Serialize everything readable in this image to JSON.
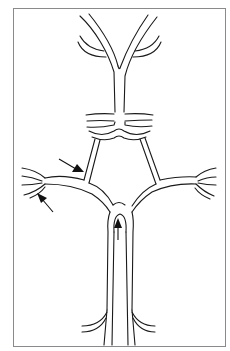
{
  "figure": {
    "type": "schematic line drawing",
    "arrows": [
      {
        "id": "arrow-left-upper",
        "direction": "down-right",
        "target": "left upper connecting segment"
      },
      {
        "id": "arrow-left-lower",
        "direction": "up-left",
        "target": "left lateral branch bifurcation"
      },
      {
        "id": "arrow-center",
        "direction": "up",
        "target": "midline junction at base of ring"
      }
    ],
    "colors": {
      "line": "#1a1a1a",
      "frame": "#8a8a8a",
      "background": "#ffffff"
    }
  }
}
